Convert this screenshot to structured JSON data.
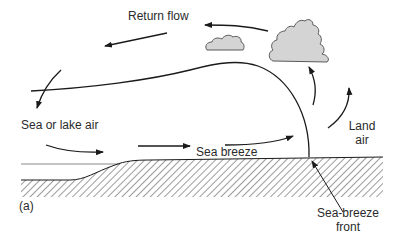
{
  "diagram": {
    "panel_label": "(a)",
    "labels": {
      "return_flow": "Return flow",
      "sea_or_lake_air": "Sea or lake air",
      "sea_breeze": "Sea breeze",
      "land_air_line1": "Land",
      "land_air_line2": "air",
      "front_line1": "Sea-breeze",
      "front_line2": "front"
    },
    "colors": {
      "line": "#1a1a1a",
      "cloud_fill": "#d4d4d4",
      "cloud_stroke": "#5a5a5a",
      "water_line": "#8a8a8a",
      "hatch": "#3a3a3a"
    }
  }
}
